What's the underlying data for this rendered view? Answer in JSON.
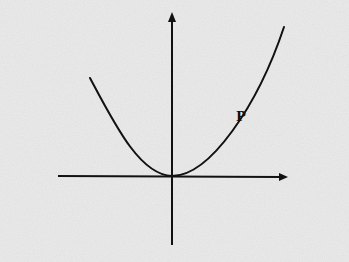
{
  "diagram": {
    "type": "parabola-sketch",
    "curve_label": "P",
    "colors": {
      "background": "#e9e9e9",
      "ink": "#111111"
    },
    "axes": {
      "x_axis": {
        "arrow": "right"
      },
      "y_axis": {
        "arrow": "up"
      }
    },
    "curve": {
      "shape": "upward-opening parabola",
      "vertex": "origin"
    }
  }
}
